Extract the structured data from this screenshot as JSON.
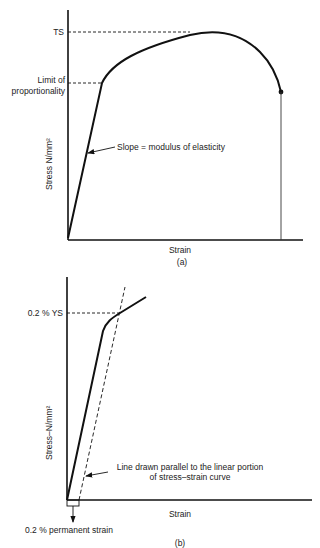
{
  "figure_a": {
    "caption": "(a)",
    "ylabel": "Stress N/mm²",
    "xlabel": "Strain",
    "labels": {
      "ts": "TS",
      "limit_line1": "Limit of",
      "limit_line2": "proportionality",
      "slope": "Slope = modulus of elasticity"
    }
  },
  "figure_b": {
    "caption": "(b)",
    "ylabel": "Stress–N/mm²",
    "xlabel": "Strain",
    "labels": {
      "ys": "0.2 % YS",
      "parallel_line1": "Line drawn parallel to the linear portion",
      "parallel_line2": "of stress–strain curve",
      "permanent_strain": "0.2 % permanent strain"
    }
  },
  "colors": {
    "line": "#111111",
    "text": "#222222",
    "background": "#ffffff"
  }
}
